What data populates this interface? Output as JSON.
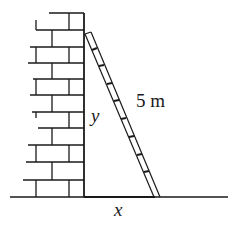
{
  "diagram": {
    "type": "ladder-against-wall",
    "labels": {
      "height": "y",
      "ladder_length": "5 m",
      "base_distance": "x"
    },
    "colors": {
      "stroke": "#1a1a1a",
      "background": "#ffffff"
    }
  }
}
